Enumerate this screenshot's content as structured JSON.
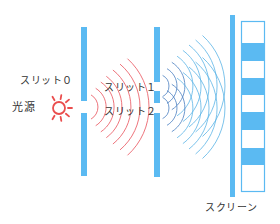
{
  "labels": {
    "slit0": "スリット０",
    "source": "光源",
    "slit1": "スリット１",
    "slit2": "スリット２",
    "screen": "スクリーン"
  },
  "colors": {
    "barrier": "#5bbaf2",
    "wave_from_source": "#e8505b",
    "wave_from_slits": "#5ab4e6",
    "wave_from_slits_dark": "#4a7fc0",
    "source_icon": "#ea4e4e",
    "text": "#333333"
  },
  "elements": {
    "light_source": {
      "icon": "sun-icon",
      "cx": 59,
      "cy": 108
    },
    "barrier1": {
      "x": 81,
      "width": 6,
      "segments": [
        [
          27,
          101
        ],
        [
          113,
          176
        ]
      ],
      "slit": "slit0"
    },
    "barrier2": {
      "x": 154,
      "width": 6,
      "segments": [
        [
          27,
          82
        ],
        [
          91,
          103
        ],
        [
          113,
          177
        ]
      ],
      "slits": [
        "slit1",
        "slit2"
      ]
    },
    "screen_bar": {
      "x": 230,
      "width": 5,
      "y1": 15,
      "y2": 197
    },
    "fringe_pattern": {
      "x": 241,
      "width": 24,
      "y1": 21,
      "y2": 192,
      "bright_bands": [
        [
          43,
          61
        ],
        [
          78,
          95
        ],
        [
          112,
          130
        ],
        [
          148,
          165
        ]
      ]
    }
  }
}
